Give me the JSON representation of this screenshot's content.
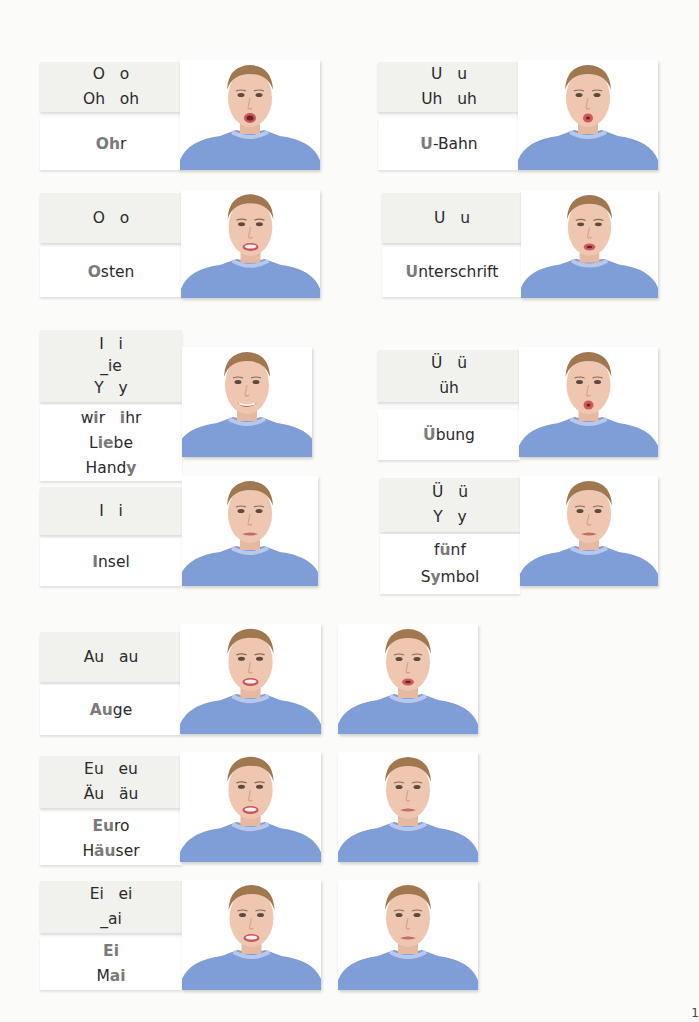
{
  "page_number": "1",
  "colors": {
    "letter_card_bg": "#f1f1ee",
    "word_card_bg": "#ffffff",
    "highlight_text": "#7a7a7a",
    "sweater": "#7f9dd6",
    "background": "#fbfbfa"
  },
  "cards": [
    {
      "id": "oh",
      "letters": [
        "O   o",
        "Oh   oh"
      ],
      "words": [
        [
          {
            "t": "Oh",
            "h": true
          },
          {
            "t": "r",
            "h": false
          }
        ]
      ],
      "mouth": "o"
    },
    {
      "id": "uh",
      "letters": [
        "U   u",
        "Uh   uh"
      ],
      "words": [
        [
          {
            "t": "U",
            "h": true
          },
          {
            "t": "-Bahn",
            "h": false
          }
        ]
      ],
      "mouth": "u"
    },
    {
      "id": "o_short",
      "letters": [
        "O   o"
      ],
      "words": [
        [
          {
            "t": "O",
            "h": true
          },
          {
            "t": "sten",
            "h": false
          }
        ]
      ],
      "mouth": "o_open"
    },
    {
      "id": "u_short",
      "letters": [
        "U   u"
      ],
      "words": [
        [
          {
            "t": "U",
            "h": true
          },
          {
            "t": "nterschrift",
            "h": false
          }
        ]
      ],
      "mouth": "u_small"
    },
    {
      "id": "ie",
      "letters": [
        "I   i",
        "_ie",
        "Y   y"
      ],
      "words": [
        [
          {
            "t": "w",
            "h": false
          },
          {
            "t": "i",
            "h": true
          },
          {
            "t": "r   ",
            "h": false
          },
          {
            "t": "i",
            "h": true
          },
          {
            "t": "hr",
            "h": false
          }
        ],
        [
          {
            "t": "L",
            "h": false
          },
          {
            "t": "ie",
            "h": true
          },
          {
            "t": "be",
            "h": false
          }
        ],
        [
          {
            "t": "Hand",
            "h": false
          },
          {
            "t": "y",
            "h": true
          }
        ]
      ],
      "mouth": "smile"
    },
    {
      "id": "i_short",
      "letters": [
        "I   i"
      ],
      "words": [
        [
          {
            "t": "I",
            "h": true
          },
          {
            "t": "nsel",
            "h": false
          }
        ]
      ],
      "mouth": "neutral"
    },
    {
      "id": "ueh",
      "letters": [
        "Ü   ü",
        "üh"
      ],
      "words": [
        [
          {
            "t": "Ü",
            "h": true
          },
          {
            "t": "bung",
            "h": false
          }
        ]
      ],
      "mouth": "u"
    },
    {
      "id": "ue_short",
      "letters": [
        "Ü   ü",
        "Y   y"
      ],
      "words": [
        [
          {
            "t": "f",
            "h": false
          },
          {
            "t": "ü",
            "h": true
          },
          {
            "t": "nf",
            "h": false
          }
        ],
        [
          {
            "t": "S",
            "h": false
          },
          {
            "t": "y",
            "h": true
          },
          {
            "t": "mbol",
            "h": false
          }
        ]
      ],
      "mouth": "neutral"
    },
    {
      "id": "au",
      "letters": [
        "Au   au"
      ],
      "words": [
        [
          {
            "t": "Au",
            "h": true
          },
          {
            "t": "ge",
            "h": false
          }
        ]
      ],
      "mouth": "o_open",
      "mouth2": "u_small"
    },
    {
      "id": "eu",
      "letters": [
        "Eu   eu",
        "Äu   äu"
      ],
      "words": [
        [
          {
            "t": "Eu",
            "h": true
          },
          {
            "t": "ro",
            "h": false
          }
        ],
        [
          {
            "t": "H",
            "h": false
          },
          {
            "t": "äu",
            "h": true
          },
          {
            "t": "ser",
            "h": false
          }
        ]
      ],
      "mouth": "o_open",
      "mouth2": "neutral"
    },
    {
      "id": "ei",
      "letters": [
        "Ei   ei",
        "_ai"
      ],
      "words": [
        [
          {
            "t": "Ei",
            "h": true
          }
        ],
        [
          {
            "t": "M",
            "h": false
          },
          {
            "t": "ai",
            "h": true
          }
        ]
      ],
      "mouth": "o_open",
      "mouth2": "neutral"
    }
  ]
}
